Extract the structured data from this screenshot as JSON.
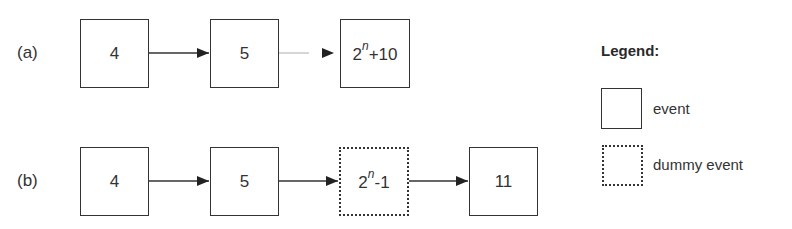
{
  "rows": [
    {
      "label": "(a)",
      "nodes": [
        {
          "text": "4",
          "type": "event"
        },
        {
          "text": "5",
          "type": "event"
        },
        {
          "base": "2",
          "exp": "n",
          "rest": "+10",
          "type": "event"
        }
      ]
    },
    {
      "label": "(b)",
      "nodes": [
        {
          "text": "4",
          "type": "event"
        },
        {
          "text": "5",
          "type": "event"
        },
        {
          "base": "2",
          "exp": "n",
          "rest": "-1",
          "type": "dummy"
        },
        {
          "text": "11",
          "type": "event"
        }
      ]
    }
  ],
  "legend": {
    "title": "Legend:",
    "items": [
      {
        "label": "event",
        "style": "solid"
      },
      {
        "label": "dummy event",
        "style": "dotted"
      }
    ]
  },
  "colors": {
    "stroke": "#333333",
    "background": "#ffffff"
  }
}
